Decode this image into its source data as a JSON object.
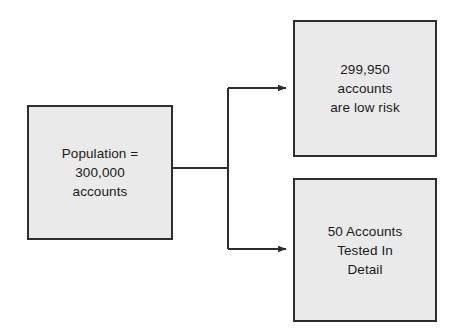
{
  "diagram": {
    "background_color": "#ffffff",
    "node_fill_color": "#eaeaea",
    "node_border_color": "#2e2e2e",
    "connector_color": "#2e2e2e",
    "nodes": [
      {
        "id": "population",
        "label": "Population =\n300,000\naccounts",
        "lines": [
          "Population =",
          "300,000",
          "accounts"
        ],
        "value": 300000,
        "role": "source"
      },
      {
        "id": "low-risk",
        "label": "299,950\naccounts\nare low risk",
        "lines": [
          "299,950",
          "accounts",
          "are low risk"
        ],
        "value": 299950,
        "role": "outcome"
      },
      {
        "id": "tested",
        "label": "50 Accounts\nTested In\nDetail",
        "lines": [
          "50 Accounts",
          "Tested In",
          "Detail"
        ],
        "value": 50,
        "role": "outcome"
      }
    ],
    "connectors": [
      {
        "id": "population-to-low-risk",
        "from": "population",
        "to": "low-risk",
        "arrow": true
      },
      {
        "id": "population-to-tested",
        "from": "population",
        "to": "tested",
        "arrow": true
      }
    ]
  }
}
